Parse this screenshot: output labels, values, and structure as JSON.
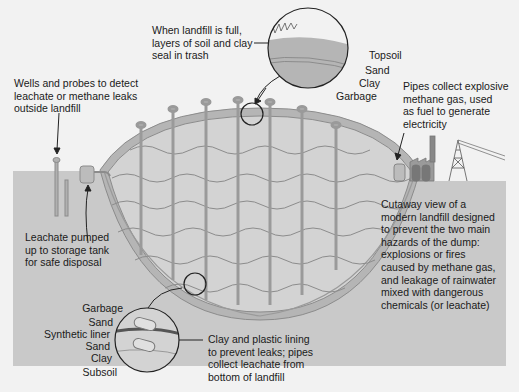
{
  "labels": {
    "cap_note": "When landfill is full,\nlayers of soil and clay\nseal in trash",
    "wells_note": "Wells and probes to detect\nleachate or methane leaks\noutside landfill",
    "pipes_note": "Pipes collect explosive\nmethane gas, used\nas fuel to generate\nelectricity",
    "leachate_note": "Leachate pumped\nup to storage tank\nfor safe disposal",
    "cutaway_note": "Cutaway view of a\nmodern landfill designed\nto prevent the two main\nhazards of the dump:\nexplosions or fires\ncaused by methane gas,\nand leakage of rainwater\nmixed with dangerous\nchemicals (or leachate)",
    "lining_note": "Clay and plastic lining\nto prevent leaks; pipes\ncollect leachate from\nbottom of landfill"
  },
  "top_inset_layers": [
    "Topsoil",
    "Sand",
    "Clay",
    "Garbage"
  ],
  "bottom_inset_layers": [
    "Garbage",
    "Sand",
    "Synthetic liner",
    "Sand",
    "Clay",
    "Subsoil"
  ],
  "colors": {
    "background": "#f2f2f2",
    "ground": "#c9c9c9",
    "landfill_fill": "#d3d3d3",
    "cap_layer": "#b5b5b5",
    "line": "#8c8c8c",
    "ink": "#1a1a1a",
    "liner": "#555555"
  }
}
